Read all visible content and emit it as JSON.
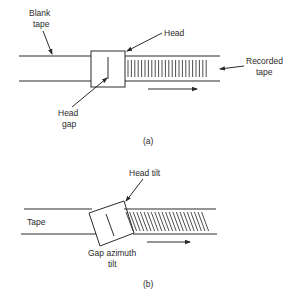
{
  "figure_a": {
    "labels": {
      "blank_tape_1": "Blank",
      "blank_tape_2": "tape",
      "head": "Head",
      "head_gap_1": "Head",
      "head_gap_2": "gap",
      "recorded_tape_1": "Recorded",
      "recorded_tape_2": "tape"
    },
    "caption": "(a)"
  },
  "figure_b": {
    "labels": {
      "tape": "Tape",
      "head_tilt": "Head tilt",
      "gap_azimuth_1": "Gap azimuth",
      "gap_azimuth_2": "tilt"
    },
    "caption": "(b)"
  }
}
